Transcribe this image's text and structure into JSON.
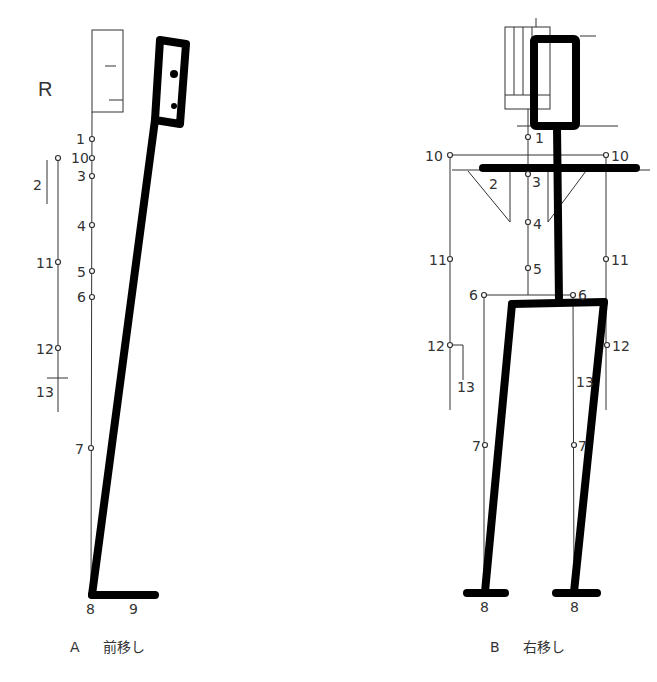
{
  "side_label": "R",
  "figure_a": {
    "caption_letter": "A",
    "caption_text": "前移し",
    "plumb_points": [
      "1",
      "10",
      "3",
      "4",
      "5",
      "6",
      "7",
      "8"
    ],
    "arm_points": [
      "10",
      "11",
      "12"
    ],
    "segment_labels": [
      "2",
      "13"
    ],
    "foot_label": "9"
  },
  "figure_b": {
    "caption_letter": "B",
    "caption_text": "右移し",
    "center_points": [
      "1",
      "3",
      "4",
      "5"
    ],
    "left_points": [
      "10",
      "11",
      "12",
      "6",
      "7",
      "8"
    ],
    "right_points": [
      "10",
      "11",
      "12",
      "6",
      "7",
      "8"
    ],
    "segment_labels": [
      "2",
      "13",
      "13"
    ]
  }
}
